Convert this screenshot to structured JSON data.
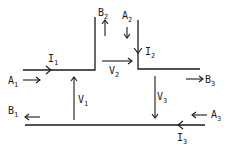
{
  "diagram": {
    "type": "flow-junction-diagram",
    "labels": {
      "A1": {
        "base": "A",
        "sub": "1"
      },
      "A2": {
        "base": "A",
        "sub": "2"
      },
      "A3": {
        "base": "A",
        "sub": "3"
      },
      "B1": {
        "base": "B",
        "sub": "1"
      },
      "B2": {
        "base": "B",
        "sub": "2"
      },
      "B3": {
        "base": "B",
        "sub": "3"
      },
      "I1": {
        "base": "I",
        "sub": "1"
      },
      "I2": {
        "base": "I",
        "sub": "2"
      },
      "I3": {
        "base": "I",
        "sub": "3"
      },
      "V1": {
        "base": "V",
        "sub": "1"
      },
      "V2": {
        "base": "V",
        "sub": "2"
      },
      "V3": {
        "base": "V",
        "sub": "3"
      }
    },
    "colors": {
      "ink": "#1a1a1a",
      "background": "#ffffff"
    }
  }
}
